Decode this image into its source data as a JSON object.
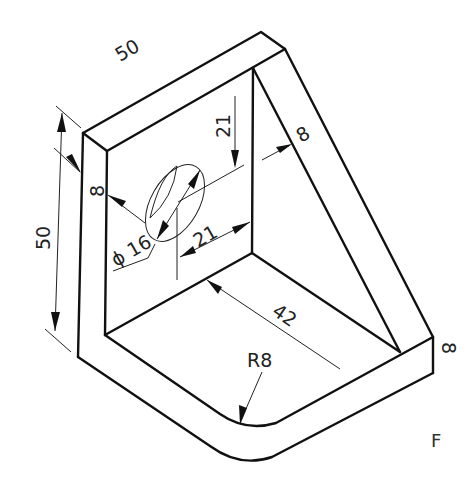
{
  "figure": {
    "type": "isometric-technical-drawing",
    "view_label": "F"
  },
  "dimensions": {
    "top_length": "50",
    "height": "50",
    "plate_thickness_left": "8",
    "rib_thickness": "8",
    "base_thickness": "8",
    "hole_vertical_offset": "21",
    "hole_horizontal_offset": "21",
    "hole_diameter": "ϕ 16",
    "base_depth": "42",
    "fillet_radius": "R8"
  },
  "colors": {
    "line": "#111111",
    "dimension_line": "#222222",
    "background": "#ffffff"
  }
}
